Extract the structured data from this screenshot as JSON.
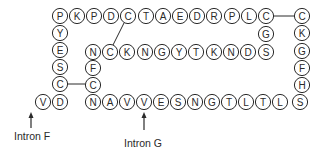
{
  "diagram": {
    "type": "peptide-sequence",
    "circle_radius": 7.6,
    "residues": [
      {
        "id": "t1",
        "aa": "P",
        "x": 60,
        "y": 16
      },
      {
        "id": "t2",
        "aa": "K",
        "x": 77,
        "y": 16
      },
      {
        "id": "t3",
        "aa": "P",
        "x": 94,
        "y": 16
      },
      {
        "id": "t4",
        "aa": "D",
        "x": 111,
        "y": 16
      },
      {
        "id": "t5",
        "aa": "C",
        "x": 128,
        "y": 16
      },
      {
        "id": "t6",
        "aa": "T",
        "x": 146,
        "y": 16
      },
      {
        "id": "t7",
        "aa": "A",
        "x": 163,
        "y": 16
      },
      {
        "id": "t8",
        "aa": "E",
        "x": 180,
        "y": 16
      },
      {
        "id": "t9",
        "aa": "D",
        "x": 197,
        "y": 16
      },
      {
        "id": "t10",
        "aa": "R",
        "x": 214,
        "y": 16
      },
      {
        "id": "t11",
        "aa": "P",
        "x": 232,
        "y": 16
      },
      {
        "id": "t12",
        "aa": "L",
        "x": 249,
        "y": 16
      },
      {
        "id": "t13",
        "aa": "C",
        "x": 266,
        "y": 16
      },
      {
        "id": "r1",
        "aa": "C",
        "x": 302,
        "y": 16
      },
      {
        "id": "r2",
        "aa": "K",
        "x": 302,
        "y": 33
      },
      {
        "id": "r3",
        "aa": "G",
        "x": 302,
        "y": 51
      },
      {
        "id": "r4",
        "aa": "F",
        "x": 302,
        "y": 68
      },
      {
        "id": "r5",
        "aa": "H",
        "x": 302,
        "y": 85
      },
      {
        "id": "r6",
        "aa": "S",
        "x": 300,
        "y": 102
      },
      {
        "id": "l1",
        "aa": "Y",
        "x": 60,
        "y": 33
      },
      {
        "id": "l2",
        "aa": "E",
        "x": 60,
        "y": 50
      },
      {
        "id": "l3",
        "aa": "S",
        "x": 60,
        "y": 67
      },
      {
        "id": "l4",
        "aa": "C",
        "x": 60,
        "y": 84
      },
      {
        "id": "l5",
        "aa": "D",
        "x": 60,
        "y": 102
      },
      {
        "id": "l6",
        "aa": "V",
        "x": 43,
        "y": 102
      },
      {
        "id": "m1",
        "aa": "G",
        "x": 266,
        "y": 34
      },
      {
        "id": "i1",
        "aa": "N",
        "x": 93,
        "y": 52
      },
      {
        "id": "i2",
        "aa": "C",
        "x": 110,
        "y": 52
      },
      {
        "id": "i3",
        "aa": "K",
        "x": 127,
        "y": 52
      },
      {
        "id": "i4",
        "aa": "N",
        "x": 145,
        "y": 52
      },
      {
        "id": "i5",
        "aa": "G",
        "x": 162,
        "y": 52
      },
      {
        "id": "i6",
        "aa": "Y",
        "x": 179,
        "y": 52
      },
      {
        "id": "i7",
        "aa": "T",
        "x": 196,
        "y": 52
      },
      {
        "id": "i8",
        "aa": "K",
        "x": 214,
        "y": 52
      },
      {
        "id": "i9",
        "aa": "N",
        "x": 231,
        "y": 52
      },
      {
        "id": "i10",
        "aa": "D",
        "x": 248,
        "y": 52
      },
      {
        "id": "i11",
        "aa": "S",
        "x": 266,
        "y": 52
      },
      {
        "id": "c1",
        "aa": "F",
        "x": 93,
        "y": 68
      },
      {
        "id": "c2",
        "aa": "C",
        "x": 93,
        "y": 85
      },
      {
        "id": "b1",
        "aa": "N",
        "x": 93,
        "y": 102
      },
      {
        "id": "b2",
        "aa": "A",
        "x": 110,
        "y": 102
      },
      {
        "id": "b3",
        "aa": "V",
        "x": 127,
        "y": 102
      },
      {
        "id": "b4",
        "aa": "V",
        "x": 144,
        "y": 102
      },
      {
        "id": "b5",
        "aa": "E",
        "x": 161,
        "y": 102
      },
      {
        "id": "b6",
        "aa": "S",
        "x": 178,
        "y": 102
      },
      {
        "id": "b7",
        "aa": "N",
        "x": 195,
        "y": 102
      },
      {
        "id": "b8",
        "aa": "G",
        "x": 212,
        "y": 102
      },
      {
        "id": "b9",
        "aa": "T",
        "x": 229,
        "y": 102
      },
      {
        "id": "b10",
        "aa": "L",
        "x": 246,
        "y": 102
      },
      {
        "id": "b11",
        "aa": "T",
        "x": 263,
        "y": 102
      },
      {
        "id": "b12",
        "aa": "L",
        "x": 280,
        "y": 102
      }
    ],
    "disulfide_bonds": [
      {
        "from": "t5",
        "to": "i2",
        "x1": 124,
        "y1": 23,
        "x2": 113,
        "y2": 45
      },
      {
        "from": "t13",
        "to": "r1",
        "x1": 274,
        "y1": 16,
        "x2": 294,
        "y2": 16
      },
      {
        "from": "l4",
        "to": "c2",
        "x1": 68,
        "y1": 84,
        "x2": 85,
        "y2": 84
      }
    ],
    "annotations": [
      {
        "label": "Intron F",
        "arrow_x": 31,
        "arrow_top": 112,
        "arrow_bottom": 128,
        "label_x": 14,
        "label_y": 130
      },
      {
        "label": "Intron G",
        "arrow_x": 144,
        "arrow_top": 112,
        "arrow_bottom": 130,
        "label_x": 124,
        "label_y": 137
      }
    ]
  },
  "labels": {
    "intron_f": "Intron F",
    "intron_g": "Intron G"
  }
}
